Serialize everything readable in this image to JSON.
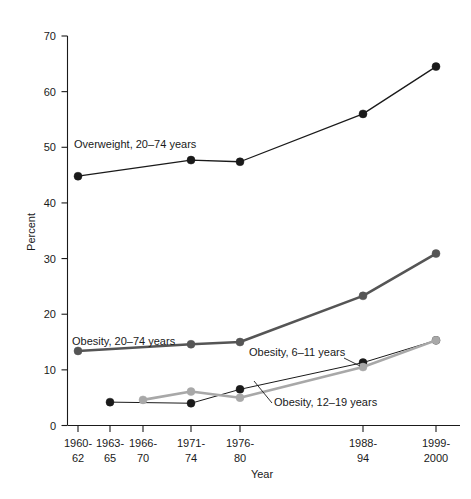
{
  "chart_data": {
    "type": "line",
    "title": "",
    "xlabel": "Year",
    "ylabel": "Percent",
    "ylim": [
      0,
      70
    ],
    "ytick_step": 10,
    "yticks": [
      "0",
      "10",
      "20",
      "30",
      "40",
      "50",
      "60",
      "70"
    ],
    "grid": false,
    "legend_position": "inline-annotations",
    "categories": [
      "1960-62",
      "1963-65",
      "1966-70",
      "1971-74",
      "1976-80",
      "1988-94",
      "1999-2000"
    ],
    "category_lines": [
      [
        "1960-",
        "62"
      ],
      [
        "1963-",
        "65"
      ],
      [
        "1966-",
        "70"
      ],
      [
        "1971-",
        "74"
      ],
      [
        "1976-",
        "80"
      ],
      [
        "1988-",
        "94"
      ],
      [
        "1999-",
        "2000"
      ]
    ],
    "series": [
      {
        "name": "Overweight, 20–74 years",
        "color": "#1a1a1a",
        "marker": "circle",
        "line_width": 1.3,
        "values": [
          44.8,
          null,
          null,
          47.7,
          47.4,
          56.0,
          64.5
        ]
      },
      {
        "name": "Obesity, 20–74 years",
        "color": "#555555",
        "marker": "circle",
        "line_width": 2.6,
        "values": [
          13.4,
          null,
          null,
          14.6,
          15.0,
          23.3,
          30.9
        ]
      },
      {
        "name": "Obesity, 6–11 years",
        "color": "#1a1a1a",
        "marker": "circle",
        "line_width": 1.0,
        "values": [
          null,
          4.2,
          null,
          4.0,
          6.5,
          11.3,
          15.3
        ]
      },
      {
        "name": "Obesity, 12–19 years",
        "color": "#a8a8a8",
        "marker": "circle",
        "line_width": 2.6,
        "values": [
          null,
          null,
          4.6,
          6.1,
          5.0,
          10.5,
          15.3
        ]
      }
    ],
    "annotations": [
      {
        "text": "Overweight, 20–74 years",
        "x": 74,
        "y": 148
      },
      {
        "text": "Obesity, 20–74 years",
        "x": 72,
        "y": 345
      },
      {
        "text": "Obesity, 6–11 years",
        "x": 249,
        "y": 356
      },
      {
        "text": "Obesity, 12–19 years",
        "x": 274,
        "y": 406
      }
    ]
  },
  "caption": {
    "text": ""
  }
}
